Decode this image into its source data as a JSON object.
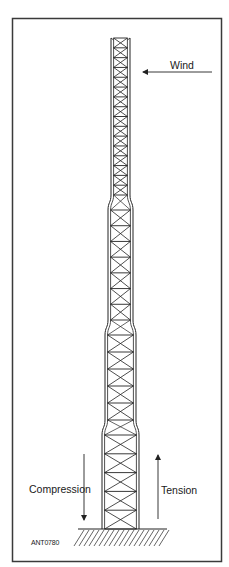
{
  "figure": {
    "frame_color": "#3a3a3a",
    "line_color": "#222222",
    "labels": {
      "wind": "Wind",
      "compression": "Compression",
      "tension": "Tension",
      "figure_code": "ANT0780"
    }
  },
  "tower": {
    "top_y": 38,
    "base_y": 529,
    "sections": [
      {
        "name": "section-1",
        "y_start": 38,
        "y_end": 195,
        "x_left": 111,
        "x_right": 130,
        "bays": 16
      },
      {
        "name": "section-2",
        "y_start": 210,
        "y_end": 320,
        "x_left": 108,
        "x_right": 133,
        "bays": 7
      },
      {
        "name": "section-3",
        "y_start": 335,
        "y_end": 420,
        "x_left": 105,
        "x_right": 136,
        "bays": 5
      },
      {
        "name": "section-4",
        "y_start": 435,
        "y_end": 529,
        "x_left": 102,
        "x_right": 139,
        "bays": 5
      }
    ]
  },
  "arrows": {
    "wind": {
      "x1": 212,
      "y1": 72,
      "x2": 143,
      "y2": 72,
      "direction": "left"
    },
    "compression": {
      "x1": 84,
      "y1": 454,
      "x2": 84,
      "y2": 520,
      "direction": "down"
    },
    "tension": {
      "x1": 158,
      "y1": 519,
      "x2": 158,
      "y2": 455,
      "direction": "up"
    }
  },
  "ground": {
    "y": 529,
    "x_start": 78,
    "x_end": 167
  }
}
